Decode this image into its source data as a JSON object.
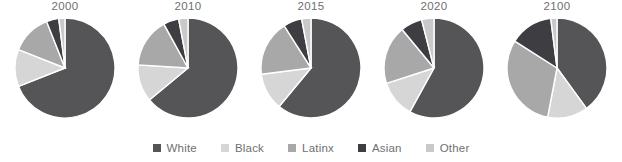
{
  "chart_data": {
    "type": "pie",
    "title": "",
    "subtitle": "",
    "xlabel": "",
    "ylabel": "",
    "legend_position": "bottom",
    "grid": false,
    "start_angle_deg": 0,
    "direction": "clockwise",
    "categories": [
      "White",
      "Black",
      "Latinx",
      "Asian",
      "Other"
    ],
    "colors": {
      "White": "#555558",
      "Black": "#d6d6d6",
      "Latinx": "#a8a8a8",
      "Asian": "#3e3e42",
      "Other": "#c9c9c9"
    },
    "panels": [
      {
        "label": "2000",
        "slices": [
          {
            "name": "White",
            "value": 69
          },
          {
            "name": "Black",
            "value": 12
          },
          {
            "name": "Latinx",
            "value": 13
          },
          {
            "name": "Asian",
            "value": 4
          },
          {
            "name": "Other",
            "value": 2
          }
        ]
      },
      {
        "label": "2010",
        "slices": [
          {
            "name": "White",
            "value": 64
          },
          {
            "name": "Black",
            "value": 12
          },
          {
            "name": "Latinx",
            "value": 16
          },
          {
            "name": "Asian",
            "value": 5
          },
          {
            "name": "Other",
            "value": 3
          }
        ]
      },
      {
        "label": "2015",
        "slices": [
          {
            "name": "White",
            "value": 61
          },
          {
            "name": "Black",
            "value": 12
          },
          {
            "name": "Latinx",
            "value": 18
          },
          {
            "name": "Asian",
            "value": 6
          },
          {
            "name": "Other",
            "value": 3
          }
        ]
      },
      {
        "label": "2020",
        "slices": [
          {
            "name": "White",
            "value": 58
          },
          {
            "name": "Black",
            "value": 12
          },
          {
            "name": "Latinx",
            "value": 19
          },
          {
            "name": "Asian",
            "value": 7
          },
          {
            "name": "Other",
            "value": 4
          }
        ]
      },
      {
        "label": "2100",
        "slices": [
          {
            "name": "White",
            "value": 40
          },
          {
            "name": "Black",
            "value": 13
          },
          {
            "name": "Latinx",
            "value": 31
          },
          {
            "name": "Asian",
            "value": 14
          },
          {
            "name": "Other",
            "value": 2
          }
        ]
      }
    ]
  },
  "legend": {
    "items": [
      {
        "label": "White",
        "color": "#555558",
        "swatch_icon": "square-swatch-icon"
      },
      {
        "label": "Black",
        "color": "#d6d6d6",
        "swatch_icon": "square-swatch-icon"
      },
      {
        "label": "Latinx",
        "color": "#a8a8a8",
        "swatch_icon": "square-swatch-icon"
      },
      {
        "label": "Asian",
        "color": "#3e3e42",
        "swatch_icon": "square-swatch-icon"
      },
      {
        "label": "Other",
        "color": "#c9c9c9",
        "swatch_icon": "square-swatch-icon"
      }
    ]
  }
}
